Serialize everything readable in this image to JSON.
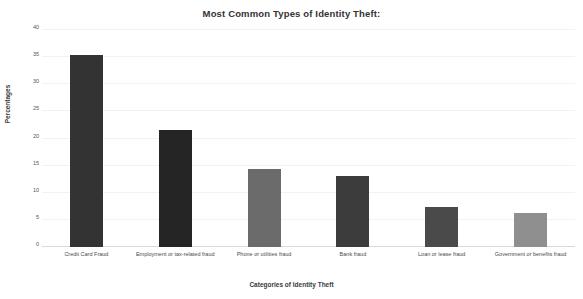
{
  "chart_data": {
    "type": "bar",
    "title": "Most Common Types of Identity Theft:",
    "xlabel": "Categories of Identity Theft",
    "ylabel": "Percentages",
    "categories": [
      "Credit Card Fraud",
      "Employment or tax-related fraud",
      "Phone or utilities fraud",
      "Bank fraud",
      "Loan or lease fraud",
      "Government or benefits fraud"
    ],
    "values": [
      35.4,
      21.6,
      14.3,
      13.0,
      7.4,
      6.3
    ],
    "bar_colors": [
      "#333333",
      "#252525",
      "#6b6b6b",
      "#3c3c3c",
      "#4a4a4a",
      "#8f8f8f"
    ],
    "ylim": [
      0,
      40
    ],
    "yticks": [
      0,
      5,
      10,
      15,
      20,
      25,
      30,
      35,
      40
    ],
    "ytick_labels": [
      "0",
      "5",
      "10",
      "15",
      "20",
      "25",
      "30",
      "35",
      "40"
    ],
    "grid": true,
    "legend": false,
    "background": "#ffffff"
  }
}
